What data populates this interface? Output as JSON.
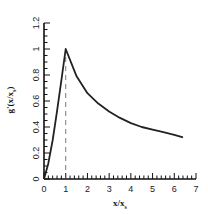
{
  "chart_data": {
    "type": "line",
    "title": "",
    "xlabel": "x/x_s",
    "ylabel": "g'(x/x_s)",
    "xlim": [
      0,
      7
    ],
    "ylim": [
      0,
      1.2
    ],
    "xticks": [
      0,
      1,
      2,
      3,
      4,
      5,
      6,
      7
    ],
    "yticks": [
      0,
      0.2,
      0.4,
      0.6,
      0.8,
      1,
      1.2
    ],
    "xtick_labels": [
      "0",
      "1",
      "2",
      "3",
      "4",
      "5",
      "6",
      "7"
    ],
    "ytick_labels": [
      "0",
      "0.2",
      "0.4",
      "0.6",
      "0.8",
      "1",
      "1.2"
    ],
    "grid": false,
    "legend": null,
    "series": [
      {
        "name": "g'(x/x_s)",
        "style": "solid",
        "x": [
          0,
          0.2,
          0.4,
          0.6,
          0.8,
          1.0,
          1.5,
          2.0,
          2.5,
          3.0,
          3.5,
          4.0,
          4.5,
          5.0,
          5.5,
          6.0,
          6.4
        ],
        "values": [
          0,
          0.12,
          0.3,
          0.52,
          0.76,
          1.0,
          0.79,
          0.66,
          0.58,
          0.52,
          0.47,
          0.43,
          0.4,
          0.38,
          0.36,
          0.34,
          0.32
        ]
      }
    ],
    "annotations": [
      {
        "type": "vertical-dashed-line",
        "x": 1,
        "from_y": 0,
        "to_y": 1
      }
    ]
  }
}
